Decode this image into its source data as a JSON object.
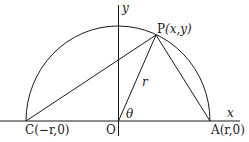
{
  "figure": {
    "axes": {
      "x_label": "x",
      "y_label": "y"
    },
    "points": {
      "P": {
        "name": "P",
        "coords": "(x,y)"
      },
      "O": {
        "name": "O"
      },
      "C": {
        "name": "C",
        "coords": "(−r,0)"
      },
      "A": {
        "name": "A",
        "coords": "(r,0)"
      }
    },
    "segment_label_r": "r",
    "angle_label": "θ",
    "colors": {
      "stroke": "#1a1a1a",
      "background": "#ffffff"
    }
  }
}
